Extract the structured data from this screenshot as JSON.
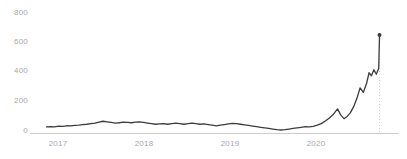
{
  "chart_data": {
    "type": "line",
    "title": "",
    "subtitle": "",
    "xlabel": "",
    "ylabel": "",
    "legend": [],
    "grid": false,
    "ylim": [
      0,
      800
    ],
    "yticks": [
      0,
      200,
      400,
      600,
      800
    ],
    "ytick_labels": [
      "0",
      "200",
      "400",
      "600",
      "800"
    ],
    "xticks": [
      2017,
      2018,
      2019,
      2020
    ],
    "xtick_labels": [
      "2017",
      "2018",
      "2019",
      "2020"
    ],
    "xlim": [
      2016.75,
      2021.08
    ],
    "line_color": "#3c3c3c",
    "axis_color": "#cccccc",
    "tick_text_color": "#a8a8a8",
    "marker_color": "#3c3c3c",
    "annotation_line_color": "#cfcfcf",
    "annotation_x": 2021.0,
    "end_marker": {
      "x": 2021.0,
      "y": 650,
      "label": ""
    },
    "series": [
      {
        "name": "price",
        "x": [
          2016.88,
          2016.93,
          2016.98,
          2017.03,
          2017.08,
          2017.13,
          2017.18,
          2017.23,
          2017.28,
          2017.33,
          2017.38,
          2017.43,
          2017.48,
          2017.53,
          2017.58,
          2017.63,
          2017.68,
          2017.73,
          2017.78,
          2017.83,
          2017.88,
          2017.93,
          2017.98,
          2018.03,
          2018.08,
          2018.13,
          2018.18,
          2018.23,
          2018.28,
          2018.33,
          2018.38,
          2018.43,
          2018.48,
          2018.53,
          2018.58,
          2018.63,
          2018.68,
          2018.73,
          2018.78,
          2018.83,
          2018.88,
          2018.93,
          2018.98,
          2019.03,
          2019.08,
          2019.13,
          2019.18,
          2019.23,
          2019.28,
          2019.33,
          2019.38,
          2019.43,
          2019.48,
          2019.53,
          2019.58,
          2019.63,
          2019.68,
          2019.73,
          2019.78,
          2019.83,
          2019.88,
          2019.93,
          2019.98,
          2020.03,
          2020.08,
          2020.13,
          2020.18,
          2020.23,
          2020.28,
          2020.33,
          2020.38,
          2020.43,
          2020.48,
          2020.52,
          2020.56,
          2020.6,
          2020.64,
          2020.68,
          2020.72,
          2020.76,
          2020.8,
          2020.84,
          2020.87,
          2020.9,
          2020.93,
          2020.96,
          2020.99,
          2021.0
        ],
        "y": [
          40,
          42,
          41,
          45,
          44,
          48,
          47,
          50,
          52,
          55,
          58,
          62,
          66,
          72,
          78,
          74,
          70,
          66,
          68,
          72,
          70,
          68,
          72,
          74,
          70,
          66,
          62,
          58,
          60,
          62,
          58,
          62,
          66,
          62,
          58,
          62,
          66,
          62,
          58,
          60,
          56,
          52,
          48,
          52,
          56,
          60,
          64,
          62,
          58,
          54,
          50,
          46,
          42,
          38,
          34,
          30,
          26,
          22,
          20,
          22,
          26,
          30,
          34,
          38,
          42,
          40,
          44,
          52,
          62,
          80,
          100,
          125,
          160,
          120,
          95,
          110,
          135,
          175,
          230,
          300,
          270,
          330,
          400,
          380,
          420,
          390,
          430,
          650
        ]
      }
    ]
  },
  "y_axis_labels": [
    {
      "text": "800",
      "top": 9
    },
    {
      "text": "600",
      "top": 38
    },
    {
      "text": "400",
      "top": 67
    },
    {
      "text": "200",
      "top": 97
    },
    {
      "text": "0",
      "top": 127
    }
  ],
  "x_axis_labels": [
    {
      "text": "2017",
      "left": 38
    },
    {
      "text": "2018",
      "left": 124
    },
    {
      "text": "2019",
      "left": 210
    },
    {
      "text": "2020",
      "left": 296
    }
  ]
}
